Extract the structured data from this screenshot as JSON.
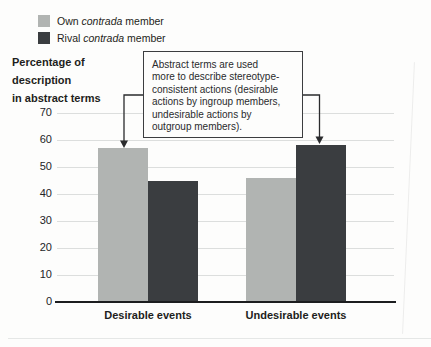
{
  "figure": {
    "kind": "grouped bar chart figure with legend and annotation callout"
  },
  "legend": {
    "items": [
      {
        "prefix": "Own",
        "italic": "contrada",
        "suffix": "member",
        "color": "#b1b4b2"
      },
      {
        "prefix": "Rival",
        "italic": "contrada",
        "suffix": "member",
        "color": "#3a3d40"
      }
    ]
  },
  "annotation": {
    "text": "Abstract terms are used more to describe stereotype-consistent actions (desirable actions by ingroup members, undesirable actions by outgroup members).",
    "lines": [
      "Abstract terms are used",
      "more to describe stereotype-",
      "consistent actions (desirable",
      "actions by ingroup members,",
      "undesirable actions by",
      "outgroup members)."
    ]
  },
  "chart_data": {
    "type": "bar",
    "title": "",
    "ylabel": "Percentage of description in abstract terms",
    "ylabel_lines": [
      "Percentage of",
      "description",
      "in abstract terms"
    ],
    "xlabel": "",
    "categories": [
      "Desirable events",
      "Undesirable events"
    ],
    "series": [
      {
        "name": "Own contrada member",
        "values": [
          57,
          46
        ],
        "color": "#b1b4b2"
      },
      {
        "name": "Rival contrada member",
        "values": [
          45,
          58
        ],
        "color": "#3a3d40"
      }
    ],
    "ylim": [
      0,
      70
    ],
    "yticks": [
      0,
      10,
      20,
      30,
      40,
      50,
      60,
      70
    ],
    "grid": true,
    "legend_position": "top-left",
    "annotation_targets": [
      "Own bar in Desirable events",
      "Rival bar in Undesirable events"
    ]
  },
  "colors": {
    "own_bar": "#b1b4b2",
    "rival_bar": "#3a3d40",
    "gridline": "#dcdedd",
    "axis_line": "#1c1d1f",
    "text": "#1d1e20",
    "annotation_border": "#3c3d3f",
    "background": "#fdfdfc"
  }
}
